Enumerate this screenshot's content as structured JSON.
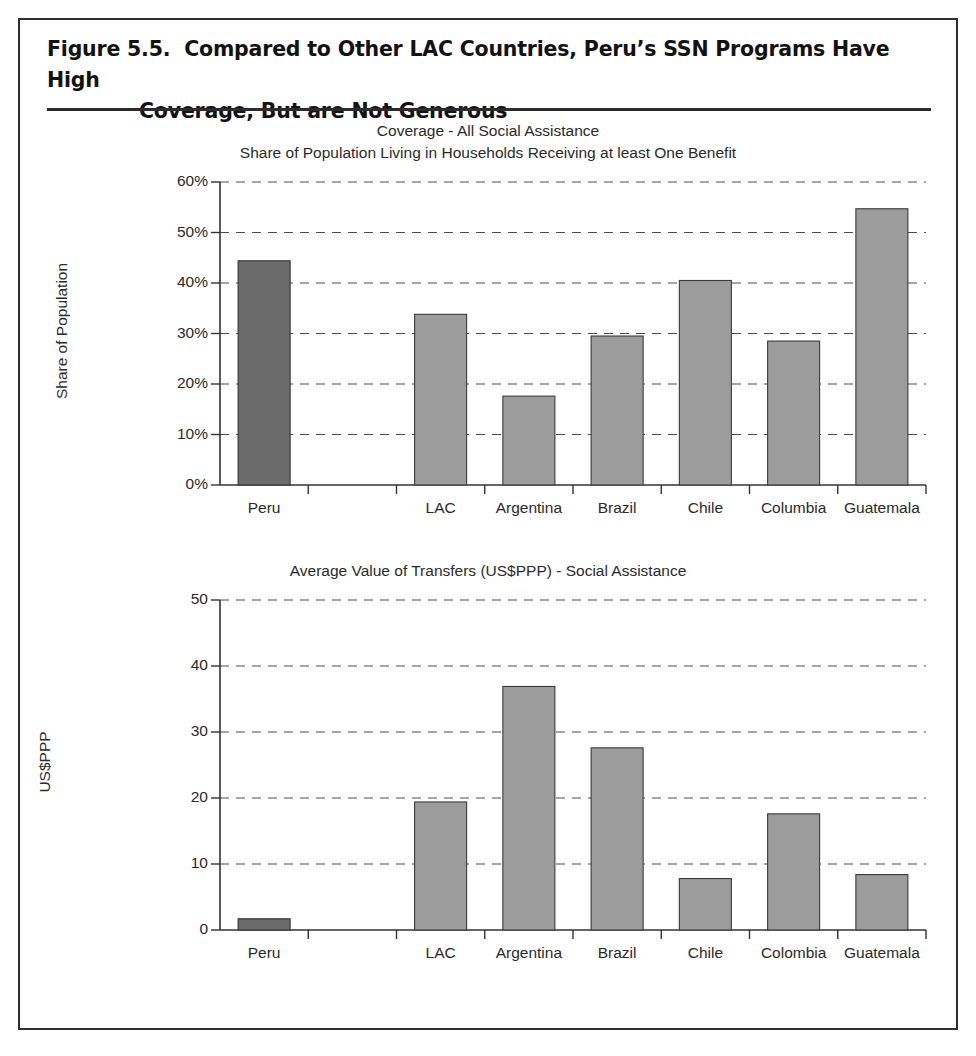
{
  "figure": {
    "title_line1": "Figure 5.5.  Compared to Other LAC Countries, Peru’s SSN Programs Have High",
    "title_line2": "Coverage, But are Not Generous"
  },
  "chart_data": [
    {
      "type": "bar",
      "title": "Coverage - All Social Assistance",
      "subtitle": "Share of Population Living in Households Receiving at least One Benefit",
      "xlabel": "",
      "ylabel": "Share of Population",
      "categories": [
        "Peru",
        "",
        "LAC",
        "Argentina",
        "Brazil",
        "Chile",
        "Columbia",
        "Guatemala"
      ],
      "values": [
        44.4,
        null,
        33.8,
        17.6,
        29.5,
        40.5,
        28.5,
        54.7
      ],
      "highlight_index": 0,
      "ylim": [
        0,
        60
      ],
      "yticks": [
        0,
        10,
        20,
        30,
        40,
        50,
        60
      ],
      "ytick_labels": [
        "0%",
        "10%",
        "20%",
        "30%",
        "40%",
        "50%",
        "60%"
      ],
      "grid": true,
      "legend": "none"
    },
    {
      "type": "bar",
      "title": "Average Value of Transfers (US$PPP) - Social Assistance",
      "subtitle": "",
      "xlabel": "",
      "ylabel": "US$PPP",
      "categories": [
        "Peru",
        "",
        "LAC",
        "Argentina",
        "Brazil",
        "Chile",
        "Colombia",
        "Guatemala"
      ],
      "values": [
        1.7,
        null,
        19.4,
        36.9,
        27.6,
        7.8,
        17.6,
        8.4
      ],
      "highlight_index": 0,
      "ylim": [
        0,
        50
      ],
      "yticks": [
        0,
        10,
        20,
        30,
        40,
        50
      ],
      "ytick_labels": [
        "0",
        "10",
        "20",
        "30",
        "40",
        "50"
      ],
      "grid": true,
      "legend": "none"
    }
  ],
  "colors": {
    "bar_fill": "#9c9c9c",
    "bar_highlight_fill": "#6b6b6b",
    "bar_stroke": "#3a3a3a",
    "grid": "#4a4a4a",
    "axis": "#333333",
    "frame": "#2e2e2e",
    "text": "#2a2a2a"
  }
}
